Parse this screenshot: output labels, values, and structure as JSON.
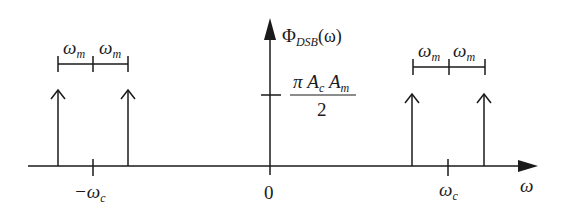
{
  "diagram": {
    "y_axis_label": {
      "symbol": "Φ",
      "subscript": "DSB",
      "argument": "(ω)"
    },
    "x_axis_label": "ω",
    "amplitude_label": {
      "numerator_pi": "π",
      "numerator_a1": "A",
      "numerator_a1_sub": "c",
      "numerator_a2": "A",
      "numerator_a2_sub": "m",
      "denominator": "2"
    },
    "x_ticks": [
      {
        "main": "−ω",
        "sub": "c"
      },
      {
        "main": "0",
        "sub": ""
      },
      {
        "main": "ω",
        "sub": "c"
      }
    ],
    "spacing_labels": {
      "main": "ω",
      "sub": "m"
    },
    "impulses": [
      "−ω_c − ω_m",
      "−ω_c + ω_m",
      "ω_c − ω_m",
      "ω_c + ω_m"
    ]
  },
  "colors": {
    "stroke": "#1a1a1a",
    "background": "#ffffff"
  }
}
